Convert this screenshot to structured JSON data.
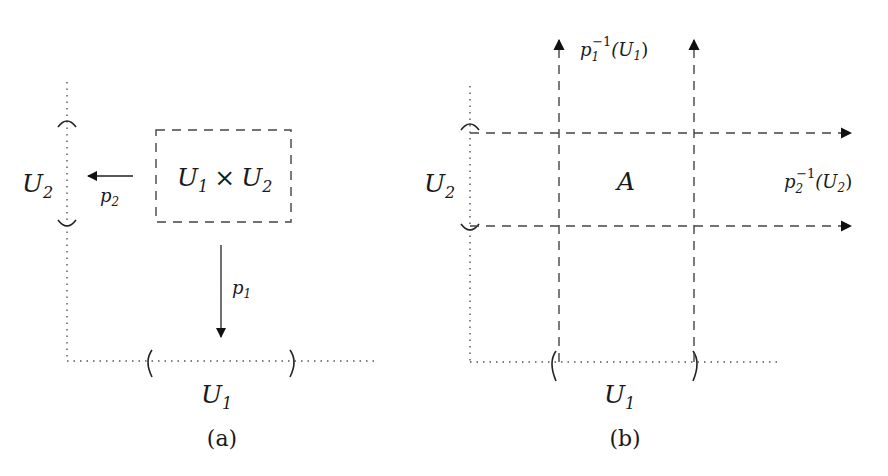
{
  "figure": {
    "panel_a": {
      "caption": "(a)",
      "axis_y_label": "U",
      "axis_y_sub": "2",
      "axis_x_label": "U",
      "axis_x_sub": "1",
      "box_label": {
        "a": "U",
        "a_sub": "1",
        "times": "×",
        "b": "U",
        "b_sub": "2"
      },
      "arrow_p1": {
        "label": "p",
        "sub": "1"
      },
      "arrow_p2": {
        "label": "p",
        "sub": "2"
      }
    },
    "panel_b": {
      "caption": "(b)",
      "axis_y_label": "U",
      "axis_y_sub": "2",
      "axis_x_label": "U",
      "axis_x_sub": "1",
      "center_label": "A",
      "preimage_1": {
        "p": "p",
        "sub": "1",
        "sup": "−1",
        "open": "(U",
        "arg_sub": "1",
        "close": ")"
      },
      "preimage_2": {
        "p": "p",
        "sub": "2",
        "sup": "−1",
        "open": "(U",
        "arg_sub": "2",
        "close": ")"
      }
    }
  }
}
